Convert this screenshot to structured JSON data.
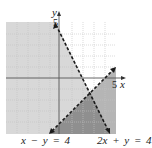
{
  "figure": {
    "type": "inequality-graph",
    "axes": {
      "x_label": "x",
      "y_label": "y",
      "x_tick_label": "5",
      "y_tick_label": "5",
      "range": [
        -5,
        5
      ]
    },
    "lines": [
      {
        "equation": "x − y = 4",
        "style": "dashed"
      },
      {
        "equation": "2x + y = 4",
        "style": "dashed"
      }
    ],
    "colors": {
      "grid_bg": "#ffffff",
      "light_shade": "#d6d6d6",
      "medium_shade": "#b3b3b3",
      "dark_shade": "#8f8f8f",
      "grid_line": "#bdbdbd",
      "axis": "#555555",
      "line": "#1a1a1a"
    }
  }
}
